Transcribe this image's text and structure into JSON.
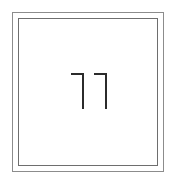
{
  "page": {
    "background_color": "#ffffff",
    "width": 176,
    "height": 183
  },
  "frame": {
    "name": "double-rule-border",
    "outer_color": "#8c8c8c",
    "inner_color": "#6e6e6e",
    "fill_color": "#ffffff"
  },
  "figure": {
    "label": "11",
    "stroke_color": "#2b2b2b",
    "marks": [
      {
        "id": "mark-left",
        "shape": "vertical-stem-with-top-left-flag"
      },
      {
        "id": "mark-right",
        "shape": "vertical-stem-with-top-left-flag"
      }
    ]
  }
}
